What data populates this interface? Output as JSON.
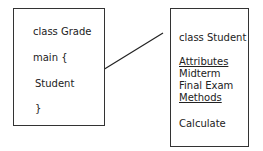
{
  "left_box": {
    "lines": [
      "class Grade",
      "main {",
      "Student",
      "}"
    ]
  },
  "right_box": {
    "title": "class Student",
    "attributes_label": "Attributes",
    "attributes": [
      "Midterm",
      "Final Exam"
    ],
    "methods_label": "Methods",
    "methods": [
      "Calculate"
    ]
  },
  "connector": {
    "from": "Student",
    "to": "class Student"
  }
}
